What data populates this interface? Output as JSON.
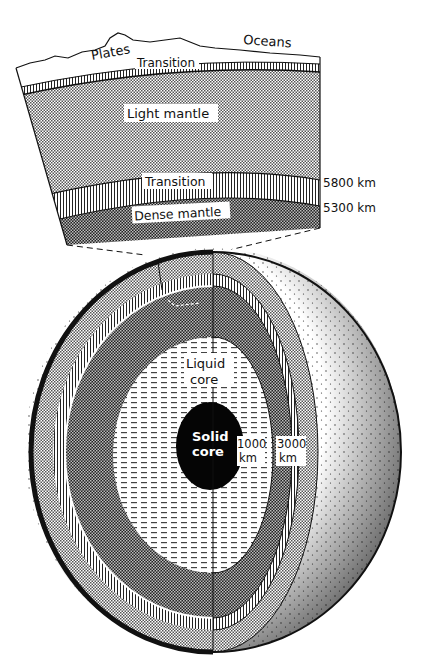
{
  "diagram": {
    "cross_section": {
      "surface_labels": {
        "plates": "Plates",
        "oceans": "Oceans"
      },
      "layers": [
        {
          "id": "upper-transition",
          "label": "Transition"
        },
        {
          "id": "light-mantle",
          "label": "Light mantle"
        },
        {
          "id": "lower-transition",
          "label": "Transition"
        },
        {
          "id": "dense-mantle",
          "label": "Dense mantle"
        }
      ],
      "depth_markers": [
        {
          "id": "radius-5800",
          "label": "5800 km"
        },
        {
          "id": "radius-5300",
          "label": "5300 km"
        }
      ]
    },
    "globe": {
      "core_labels": {
        "liquid_line1": "Liquid",
        "liquid_line2": "core",
        "solid_line1": "Solid",
        "solid_line2": "core"
      },
      "radius_markers": [
        {
          "id": "radius-1000",
          "value": "1000",
          "unit": "km"
        },
        {
          "id": "radius-3000",
          "value": "3000",
          "unit": "km"
        }
      ]
    },
    "colors": {
      "ink": "#111111",
      "paper": "#ffffff"
    }
  }
}
